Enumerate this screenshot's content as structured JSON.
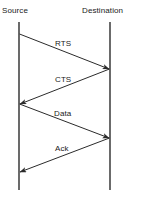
{
  "diagram": {
    "type": "sequence-diagram",
    "title": "",
    "background_color": "#ffffff",
    "line_color": "#2b2b2b",
    "text_color": "#1a1a1a",
    "lifelines": [
      {
        "id": "source",
        "label": "Source",
        "x": 19,
        "top": 22,
        "bottom": 190
      },
      {
        "id": "destination",
        "label": "Destination",
        "x": 110,
        "top": 22,
        "bottom": 190
      }
    ],
    "messages": [
      {
        "id": "rts",
        "label": "RTS",
        "from": "source",
        "to": "destination",
        "direction": "right",
        "y_start": 34,
        "y_end": 69
      },
      {
        "id": "cts",
        "label": "CTS",
        "from": "destination",
        "to": "source",
        "direction": "left",
        "y_start": 69,
        "y_end": 104
      },
      {
        "id": "data",
        "label": "Data",
        "from": "source",
        "to": "destination",
        "direction": "right",
        "y_start": 104,
        "y_end": 138
      },
      {
        "id": "ack",
        "label": "Ack",
        "from": "destination",
        "to": "source",
        "direction": "left",
        "y_start": 138,
        "y_end": 172
      }
    ]
  }
}
